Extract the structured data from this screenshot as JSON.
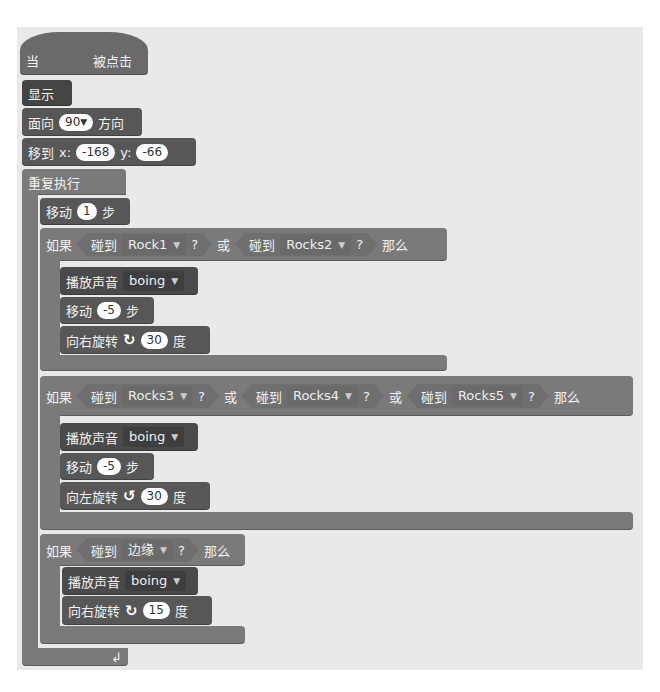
{
  "script": {
    "hat": {
      "prefix": "当",
      "suffix": "被点击"
    },
    "show": {
      "label": "显示"
    },
    "point": {
      "prefix": "面向",
      "value": "90",
      "suffix": "方向"
    },
    "goto": {
      "prefix": "移到",
      "x_label": "x:",
      "x": "-168",
      "y_label": "y:",
      "y": "-66"
    },
    "forever": {
      "label": "重复执行"
    },
    "move1": {
      "prefix": "移动",
      "value": "1",
      "suffix": "步"
    },
    "if1": {
      "if_label": "如果",
      "then_label": "那么",
      "or_label": "或",
      "touch_label": "碰到",
      "q": "?",
      "targets": [
        "Rock1",
        "Rocks2"
      ],
      "body": {
        "sound": {
          "label": "播放声音",
          "value": "boing"
        },
        "move": {
          "prefix": "移动",
          "value": "-5",
          "suffix": "步"
        },
        "turn": {
          "prefix": "向右旋转",
          "value": "30",
          "suffix": "度",
          "icon": "turn-right-icon"
        }
      }
    },
    "if2": {
      "if_label": "如果",
      "then_label": "那么",
      "or_label": "或",
      "touch_label": "碰到",
      "q": "?",
      "targets": [
        "Rocks3",
        "Rocks4",
        "Rocks5"
      ],
      "body": {
        "sound": {
          "label": "播放声音",
          "value": "boing"
        },
        "move": {
          "prefix": "移动",
          "value": "-5",
          "suffix": "步"
        },
        "turn": {
          "prefix": "向左旋转",
          "value": "30",
          "suffix": "度",
          "icon": "turn-left-icon"
        }
      }
    },
    "if3": {
      "if_label": "如果",
      "then_label": "那么",
      "touch_label": "碰到",
      "q": "?",
      "target": "边缘",
      "body": {
        "sound": {
          "label": "播放声音",
          "value": "boing"
        },
        "turn": {
          "prefix": "向右旋转",
          "value": "15",
          "suffix": "度",
          "icon": "turn-right-icon"
        }
      }
    },
    "loop_icon": "loop-arrow-icon"
  }
}
